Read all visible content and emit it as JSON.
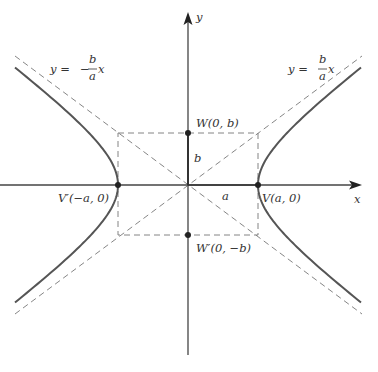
{
  "diagram": {
    "type": "hyperbola",
    "colors": {
      "axis": "#444444",
      "curve": "#555555",
      "dashed": "#777777",
      "text": "#333333",
      "point": "#222222"
    },
    "axes": {
      "x_label": "x",
      "y_label": "y"
    },
    "asymptotes": {
      "positive": {
        "lhs": "y =",
        "num": "b",
        "den": "a",
        "var": "x"
      },
      "negative": {
        "lhs": "y =",
        "sign": "−",
        "num": "b",
        "den": "a",
        "var": "x"
      }
    },
    "points": {
      "V": "V(a, 0)",
      "V_prime": "V′(−a, 0)",
      "W": "W(0, b)",
      "W_prime": "W′(0, −b)"
    },
    "segment_labels": {
      "a": "a",
      "b": "b"
    }
  }
}
